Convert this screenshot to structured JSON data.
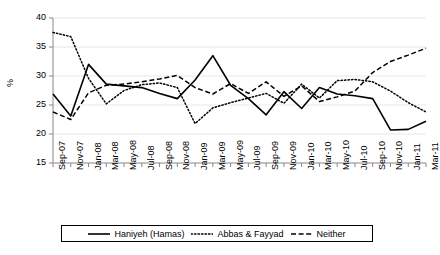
{
  "chart_data": {
    "type": "line",
    "title": "",
    "xlabel": "",
    "ylabel": "%",
    "ylim": [
      15,
      40
    ],
    "ytick_step": 5,
    "yticks": [
      15,
      20,
      25,
      30,
      35,
      40
    ],
    "grid": true,
    "legend_position": "bottom",
    "categories": [
      "Sep-07",
      "Nov-07",
      "Jan-08",
      "Mar-08",
      "May-08",
      "Jul-08",
      "Sep-08",
      "Nov-08",
      "Jan-09",
      "Mar-09",
      "May-09",
      "Jul-09",
      "Sep-09",
      "Nov-09",
      "Jan-10",
      "Mar-10",
      "May-10",
      "Jul-10",
      "Sep-10",
      "Nov-10",
      "Jan-11",
      "Mar-11"
    ],
    "series": [
      {
        "name": "Haniyeh (Hamas)",
        "style": "solid",
        "color": "#000000",
        "values": [
          26.9,
          23.1,
          32.0,
          28.6,
          28.3,
          28.0,
          27.0,
          26.1,
          29.3,
          33.5,
          28.4,
          26.1,
          23.3,
          27.3,
          24.4,
          28.0,
          26.9,
          26.6,
          26.1,
          20.7,
          20.8,
          22.2
        ]
      },
      {
        "name": "Abbas & Fayyad",
        "style": "dotted",
        "color": "#000000",
        "values": [
          37.5,
          36.8,
          29.6,
          25.2,
          27.5,
          28.5,
          28.8,
          28.0,
          21.8,
          24.5,
          25.4,
          26.2,
          27.0,
          25.3,
          28.6,
          26.2,
          29.2,
          29.4,
          29.0,
          27.4,
          25.4,
          23.8
        ]
      },
      {
        "name": "Neither",
        "style": "dashed",
        "color": "#000000",
        "values": [
          23.8,
          22.5,
          27.1,
          28.4,
          28.6,
          29.0,
          29.5,
          30.1,
          28.0,
          26.9,
          28.7,
          27.0,
          29.0,
          26.5,
          28.3,
          25.6,
          26.4,
          27.4,
          30.6,
          32.5,
          33.6,
          34.8
        ]
      }
    ]
  },
  "legend": {
    "items": [
      {
        "label": "Haniyeh (Hamas)",
        "style": "solid"
      },
      {
        "label": "Abbas & Fayyad",
        "style": "dotted"
      },
      {
        "label": "Neither",
        "style": "dashed"
      }
    ]
  }
}
